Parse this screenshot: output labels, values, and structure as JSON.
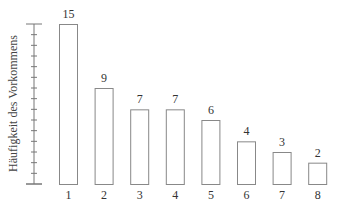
{
  "chart_data": {
    "type": "bar",
    "title": "",
    "xlabel": "",
    "ylabel": "Häufigkeit des Vorkommens",
    "categories": [
      "1",
      "2",
      "3",
      "4",
      "5",
      "6",
      "7",
      "8"
    ],
    "values": [
      15,
      9,
      7,
      7,
      6,
      4,
      3,
      2
    ],
    "ylim": [
      0,
      15
    ],
    "y_ticks_count": 15,
    "y_tick_labels": false,
    "data_labels": true,
    "grid": false,
    "legend": null,
    "colors": {
      "bar_fill": "#ffffff",
      "bar_stroke": "#888888",
      "axis": "#777777",
      "text": "#333333"
    }
  }
}
